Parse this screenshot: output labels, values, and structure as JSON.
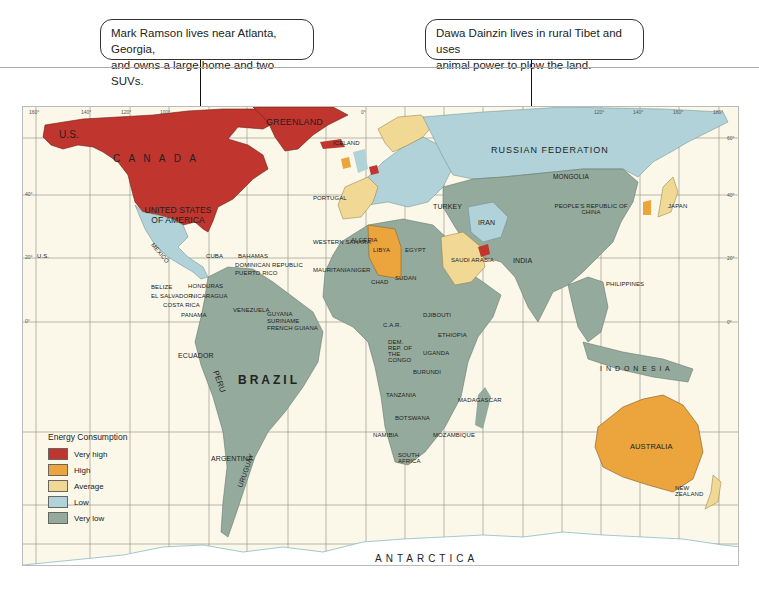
{
  "callouts": [
    {
      "text_line1": "Mark Ramson lives near Atlanta, Georgia,",
      "text_line2": "and owns a large home and two SUVs.",
      "points_to": "Atlanta, Georgia"
    },
    {
      "text_line1": "Dawa Dainzin lives in rural Tibet and uses",
      "text_line2": "animal power to plow the land.",
      "points_to": "Tibet"
    }
  ],
  "legend": {
    "title": "Energy Consumption",
    "items": [
      {
        "label": "Very high",
        "color": "#c0352d"
      },
      {
        "label": "High",
        "color": "#eba53c"
      },
      {
        "label": "Average",
        "color": "#f1d894"
      },
      {
        "label": "Low",
        "color": "#b0d2d8"
      },
      {
        "label": "Very low",
        "color": "#94aa9c"
      }
    ]
  },
  "colors": {
    "very_high": "#c0352d",
    "high": "#eba53c",
    "average": "#f1d894",
    "low": "#b0d2d8",
    "very_low": "#94aa9c",
    "ocean": "#fbf8ea",
    "grid": "#8c8a7c"
  },
  "axes": {
    "longitude_ticks": [
      "160°",
      "140°",
      "120°",
      "100°",
      "80°",
      "60°",
      "40°",
      "20°",
      "0°",
      "20°",
      "40°",
      "60°",
      "80°",
      "100°",
      "120°",
      "140°",
      "160°",
      "180°"
    ],
    "latitude_ticks": [
      "60°",
      "40°",
      "20°",
      "0°",
      "20°",
      "40°",
      "60°"
    ]
  },
  "regions": {
    "continent_labels": {
      "canada": "C A N A D A",
      "usa": "UNITED STATES OF AMERICA",
      "us_alaska": "U.S.",
      "us_hawaii": "U.S.",
      "greenland": "GREENLAND",
      "iceland": "ICELAND",
      "russia": "RUSSIAN   FEDERATION",
      "brazil": "BRAZIL",
      "antarctica": "ANTARCTICA",
      "australia": "AUSTRALIA",
      "indonesia": "I N D O N E S I A",
      "china": "PEOPLE'S REPUBLIC OF CHINA",
      "mongolia": "MONGOLIA",
      "india": "INDIA",
      "japan": "JAPAN"
    },
    "americas": [
      "MEXICO",
      "CUBA",
      "BAHAMAS",
      "DOMINICAN REPUBLIC",
      "PUERTO RICO",
      "JAMAICA",
      "BELIZE",
      "HONDURAS",
      "GUATEMALA",
      "EL SALVADOR",
      "NICARAGUA",
      "COSTA RICA",
      "PANAMA",
      "ANTIGUA AND BARBUDA",
      "DOMINICA",
      "ST VINCENT",
      "ST LUCIA",
      "BARBADOS",
      "GRENADA",
      "TRINIDAD & TOBAGO",
      "VENEZUELA",
      "GUYANA",
      "SURINAME",
      "FRENCH GUIANA",
      "COLOMBIA",
      "ECUADOR",
      "PERU",
      "BOLIVIA",
      "PARAGUAY",
      "CHILE",
      "ARGENTINA",
      "URUGUAY"
    ],
    "europe": [
      "NORWAY",
      "SWEDEN",
      "FINLAND",
      "ESTONIA",
      "LATVIA",
      "LITHUANIA",
      "IRELAND",
      "GREAT BRITAIN",
      "DENMARK",
      "NETHERLANDS",
      "BELGIUM",
      "LUX.",
      "SWITZ.",
      "FRANCE",
      "SPAIN",
      "PORTUGAL",
      "POLAND",
      "BELARUS",
      "UKRAINE",
      "MOLDOVA",
      "ROMANIA",
      "ITALY",
      "MALTA",
      "TURKEY"
    ],
    "africa": [
      "MOROCCO",
      "ALGERIA",
      "TUNISIA",
      "LIBYA",
      "EGYPT",
      "WESTERN SAHARA",
      "MAURITANIA",
      "MALI",
      "NIGER",
      "CHAD",
      "SUDAN",
      "SENEGAL",
      "CAPE VERDE",
      "GAMBIA",
      "GUINEA-BISSAU",
      "GUINEA",
      "SIERRA LEONE",
      "LIBERIA",
      "IVORY COAST",
      "BURKINA FASO",
      "GHANA",
      "TOGO",
      "BENIN",
      "NIGERIA",
      "CAMEROON",
      "EQUATORIAL GUINEA",
      "SAO TOME & PRINCIPE",
      "GABON",
      "CONGO",
      "C.A.R.",
      "DEM. REP. OF THE CONGO",
      "ERITREA",
      "DJIBOUTI",
      "ETHIOPIA",
      "SOMALIA",
      "UGANDA",
      "KENYA",
      "RWANDA",
      "BURUNDI",
      "TANZANIA",
      "ANGOLA",
      "ZAMBIA",
      "MALAWI",
      "ZIMBABWE",
      "MOZAMBIQUE",
      "BOTSWANA",
      "NAMIBIA",
      "SOUTH AFRICA",
      "SWAZILAND",
      "LESOTHO",
      "MADAGASCAR",
      "COMOROS",
      "SEYCHELLES",
      "MAURITIUS"
    ],
    "asia": [
      "GEORGIA",
      "SYRIA",
      "LEBANON",
      "ISRAEL",
      "IRAQ",
      "IRAN",
      "AZERBAIJAN",
      "TURKMENISTAN",
      "KAZAKHSTAN",
      "UZBEKISTAN",
      "KYRGYZSTAN",
      "TAJIKISTAN",
      "AFGHANISTAN",
      "PAKISTAN",
      "KUWAIT",
      "BAHRAIN",
      "QATAR",
      "U.A.E.",
      "SAUDI ARABIA",
      "OMAN",
      "YEMEN",
      "NEPAL",
      "BHUTAN",
      "BANGLADESH",
      "MYANMAR",
      "LAOS",
      "VIETNAM",
      "THAILAND",
      "CAMBODIA",
      "SRI LANKA",
      "MALDIVES",
      "N. KOREA",
      "S. KOREA",
      "TAIWAN, REPUBLIC OF CHINA",
      "HONG KONG",
      "MACAO",
      "PHILIPPINES",
      "BRUNEI",
      "MALAYSIA",
      "SINGAPORE"
    ],
    "oceania": [
      "EAST TIMOR",
      "PAPUA NEW GUINEA",
      "FEDERATED STATES OF MICRONESIA",
      "MARSHALL ISLANDS",
      "NAURU",
      "KIRIBATI",
      "SOLOMON ISLANDS",
      "TUVALU",
      "WESTERN SAMOA",
      "VANUATU",
      "FIJI",
      "NEW CALEDONIA",
      "TONGA",
      "NEW ZEALAND"
    ]
  }
}
